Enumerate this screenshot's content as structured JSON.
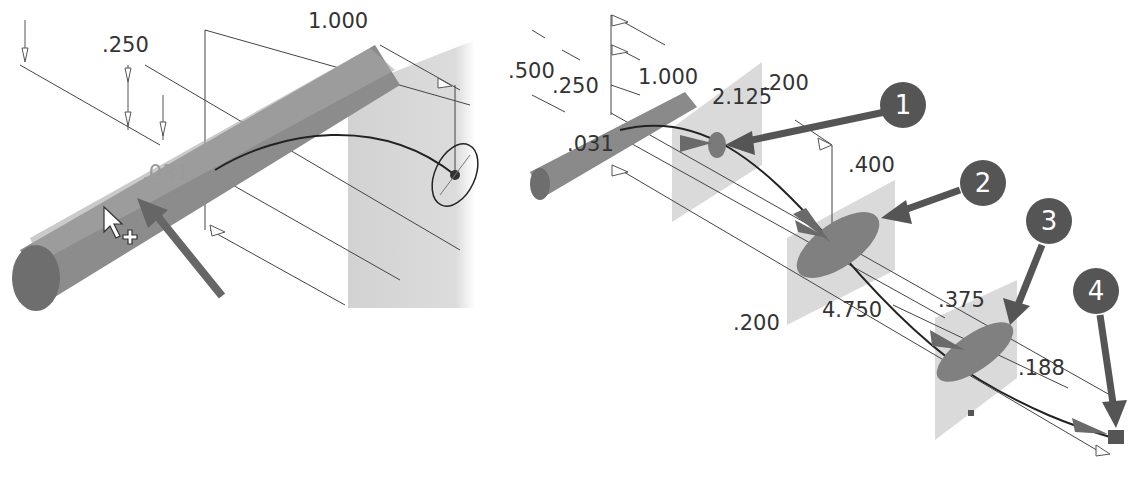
{
  "left_view": {
    "dimensions": {
      "top": "1.000",
      "upper": ".250",
      "lower": ".031"
    }
  },
  "right_view": {
    "dimensions": {
      "d500": ".500",
      "d250": ".250",
      "d1000": "1.000",
      "d2125": "2.125",
      "d200_top": ".200",
      "d031": ".031",
      "d400": ".400",
      "d200_bottom": ".200",
      "d4750": "4.750",
      "d375": ".375",
      "d188": ".188"
    },
    "callouts": [
      {
        "label": "1"
      },
      {
        "label": "2"
      },
      {
        "label": "3"
      },
      {
        "label": "4"
      }
    ]
  },
  "colors": {
    "solid": "#8a8a8a",
    "plane": "#d6d6d6",
    "callout": "#555555",
    "line": "#333333"
  }
}
